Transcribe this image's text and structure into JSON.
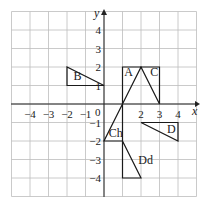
{
  "diagram": {
    "type": "coordinate-grid",
    "grid": {
      "xmin": -5,
      "xmax": 5,
      "ymin": -5,
      "ymax": 5,
      "origin_px": [
        104,
        104
      ],
      "unit_px": 18.5
    },
    "axes": {
      "x_label": "x",
      "y_label": "y",
      "origin_label": "0"
    },
    "x_ticks": [
      {
        "value": -4,
        "label": "−4"
      },
      {
        "value": -3,
        "label": "−3"
      },
      {
        "value": -2,
        "label": "−2"
      },
      {
        "value": -1,
        "label": "−1"
      },
      {
        "value": 2,
        "label": "2"
      },
      {
        "value": 3,
        "label": "3"
      },
      {
        "value": 4,
        "label": "4"
      }
    ],
    "y_ticks": [
      {
        "value": 4,
        "label": "4"
      },
      {
        "value": 3,
        "label": "3"
      },
      {
        "value": 2,
        "label": "2"
      },
      {
        "value": 1,
        "label": "1"
      },
      {
        "value": -1,
        "label": "−1"
      },
      {
        "value": -2,
        "label": "−2"
      },
      {
        "value": -3,
        "label": "−3"
      },
      {
        "value": -4,
        "label": "−4"
      }
    ],
    "shapes": [
      {
        "label": "B",
        "vertices": [
          [
            -2,
            2
          ],
          [
            -2,
            1
          ],
          [
            0,
            1
          ]
        ],
        "label_pos": [
          -1.65,
          1.3
        ]
      },
      {
        "label": "A",
        "vertices": [
          [
            1,
            0
          ],
          [
            1,
            2
          ],
          [
            2,
            2
          ]
        ],
        "label_pos": [
          1.1,
          1.5
        ]
      },
      {
        "label": "C",
        "vertices": [
          [
            2,
            2
          ],
          [
            3,
            2
          ],
          [
            3,
            0
          ]
        ],
        "label_pos": [
          2.5,
          1.5
        ]
      },
      {
        "label": "D",
        "vertices": [
          [
            2,
            -1
          ],
          [
            4,
            -1
          ],
          [
            4,
            -2
          ]
        ],
        "label_pos": [
          3.4,
          -1.55
        ]
      },
      {
        "label": "Ch",
        "vertices": [
          [
            0,
            -2
          ],
          [
            1,
            -2
          ],
          [
            1,
            0
          ]
        ],
        "label_pos": [
          0.25,
          -1.8
        ]
      },
      {
        "label": "Dd",
        "vertices": [
          [
            1,
            -2
          ],
          [
            1,
            -4
          ],
          [
            2,
            -4
          ]
        ],
        "label_pos": [
          1.85,
          -3.25
        ]
      }
    ]
  }
}
